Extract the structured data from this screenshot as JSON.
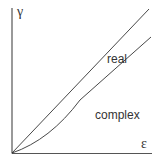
{
  "diagram": {
    "y_axis_label": "γ",
    "x_axis_label": "ε",
    "regions": [
      {
        "name": "real",
        "label": "real"
      },
      {
        "name": "complex",
        "label": "complex"
      }
    ],
    "curves": [
      {
        "name": "upper-boundary",
        "shape": "straight line from origin"
      },
      {
        "name": "lower-boundary",
        "shape": "convex curve from origin, approaching parallel to upper line"
      }
    ],
    "colors": {
      "line": "#333333",
      "axis": "#555555",
      "background": "#ffffff"
    }
  }
}
